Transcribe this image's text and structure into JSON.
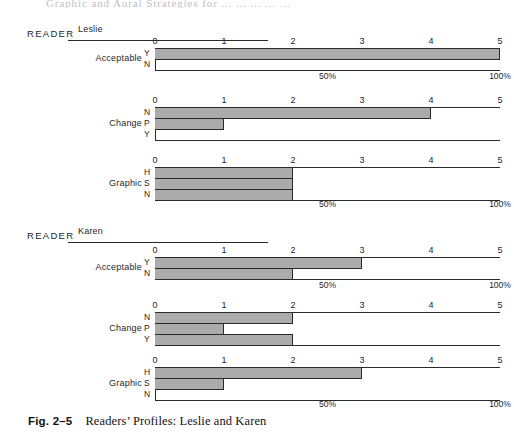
{
  "page": {
    "top_cut_text": "Graphic and Aural Strategies for ... ... ... ... ...",
    "caption_number": "Fig. 2–5",
    "caption_text": "Readers’ Profiles: Leslie and Karen"
  },
  "labels": {
    "reader_word": "READER",
    "tick_labels": [
      "0",
      "1",
      "2",
      "3",
      "4",
      "5"
    ],
    "pct_50": "50%",
    "pct_100": "100%"
  },
  "chart_data": {
    "type": "bar",
    "title": "Readers’ Profiles: Leslie and Karen",
    "orientation": "horizontal",
    "xlabel": "",
    "ylabel": "",
    "xlim": [
      0,
      5
    ],
    "xticks": [
      0,
      1,
      2,
      3,
      4,
      5
    ],
    "xtick_labels": [
      "0",
      "1",
      "2",
      "3",
      "4",
      "5"
    ],
    "secondary_axis_labels": {
      "50%": 2.5,
      "100%": 5
    },
    "grid": false,
    "legend": "none",
    "bar_fill_color": "#ababab",
    "bar_edge_color": "#2a2a2a",
    "panels": [
      {
        "reader": "Leslie",
        "charts": [
          {
            "name": "Acceptable",
            "categories": [
              "Y",
              "N"
            ],
            "values": [
              5,
              0
            ]
          },
          {
            "name": "Change",
            "categories": [
              "N",
              "P",
              "Y"
            ],
            "values": [
              4,
              1,
              0
            ]
          },
          {
            "name": "Graphic",
            "categories": [
              "H",
              "S",
              "N"
            ],
            "values": [
              2,
              2,
              2
            ]
          }
        ]
      },
      {
        "reader": "Karen",
        "charts": [
          {
            "name": "Acceptable",
            "categories": [
              "Y",
              "N"
            ],
            "values": [
              3,
              2
            ]
          },
          {
            "name": "Change",
            "categories": [
              "N",
              "P",
              "Y"
            ],
            "values": [
              2,
              1,
              2
            ]
          },
          {
            "name": "Graphic",
            "categories": [
              "H",
              "S",
              "N"
            ],
            "values": [
              3,
              1,
              0
            ]
          }
        ]
      }
    ]
  },
  "layout": {
    "plot_left": 155,
    "plot_width": 345,
    "units": 5,
    "panels": [
      {
        "header_top": 24,
        "rule_width": 200,
        "charts": [
          {
            "tick_top": 36,
            "axis_top": 48,
            "row_height": 11,
            "show_pct": true,
            "pct_top": 71
          },
          {
            "tick_top": 95,
            "axis_top": 107,
            "row_height": 11,
            "show_pct": false,
            "pct_top": 0
          },
          {
            "tick_top": 155,
            "axis_top": 167,
            "row_height": 11,
            "show_pct": true,
            "pct_top": 199
          }
        ]
      },
      {
        "header_top": 226,
        "rule_width": 200,
        "charts": [
          {
            "tick_top": 245,
            "axis_top": 257,
            "row_height": 11,
            "show_pct": true,
            "pct_top": 280
          },
          {
            "tick_top": 300,
            "axis_top": 312,
            "row_height": 11,
            "show_pct": false,
            "pct_top": 0
          },
          {
            "tick_top": 355,
            "axis_top": 367,
            "row_height": 11,
            "show_pct": true,
            "pct_top": 399
          }
        ]
      }
    ]
  }
}
